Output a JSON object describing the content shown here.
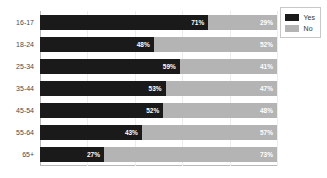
{
  "chart_data": {
    "type": "bar",
    "orientation": "horizontal",
    "stacked": true,
    "stack_total": 100,
    "title": "",
    "subtitle": "",
    "xlabel": "",
    "ylabel": "",
    "xlim": [
      0,
      100
    ],
    "grid": true,
    "grid_axis": "x",
    "gridline_values": [
      20,
      40,
      60,
      80,
      100
    ],
    "xtick_labels": [],
    "legend_position": "top-right",
    "categories": [
      "16-17",
      "18-24",
      "25-34",
      "35-44",
      "45-54",
      "55-64",
      "65+"
    ],
    "series": [
      {
        "name": "Yes",
        "color": "#1a1a1a",
        "values": [
          71,
          48,
          59,
          53,
          52,
          43,
          27
        ],
        "labels": [
          "71%",
          "48%",
          "59%",
          "53%",
          "52%",
          "43%",
          "27%"
        ]
      },
      {
        "name": "No",
        "color": "#b4b4b4",
        "values": [
          29,
          52,
          41,
          47,
          48,
          57,
          73
        ],
        "labels": [
          "29%",
          "52%",
          "41%",
          "47%",
          "48%",
          "57%",
          "73%"
        ]
      }
    ]
  },
  "legend": {
    "items": [
      {
        "label": "Yes",
        "color": "#1a1a1a"
      },
      {
        "label": "No",
        "color": "#b4b4b4"
      }
    ]
  },
  "colors": {
    "yes": "#1a1a1a",
    "no": "#b4b4b4",
    "axis": "#b9b9b9",
    "gridline": "#ececec",
    "category_text": "#4a4a4a",
    "value_text": "#ffffff",
    "background": "#ffffff"
  }
}
